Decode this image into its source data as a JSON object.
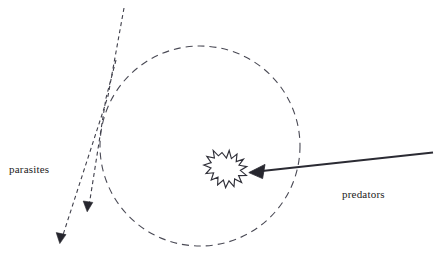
{
  "diagram": {
    "background_color": "#ffffff",
    "stroke_color": "#3a3a46",
    "arrow_color": "#2b2b33",
    "text_color": "#1b1b1b",
    "labels": {
      "parasites": "parasites",
      "predators": "predators"
    },
    "shapes": {
      "population_circle": {
        "name": "dashed-circle",
        "center_x": 200,
        "center_y": 146,
        "radius": 100,
        "style": "dashed"
      },
      "burst": {
        "name": "starburst",
        "center_x": 222,
        "center_y": 170,
        "radius": 17,
        "points": 13
      },
      "predator_arrow": {
        "name": "predator-arrow",
        "from_x": 433,
        "from_y": 152,
        "to_x": 249,
        "to_y": 172,
        "style": "solid"
      },
      "parasite_arrow_long": {
        "name": "parasite-arrow-long",
        "from_x": 124,
        "from_y": 8,
        "to_x": 59,
        "to_y": 243,
        "style": "dashed"
      },
      "parasite_arrow_short": {
        "name": "parasite-arrow-short",
        "from_x": 116,
        "from_y": 60,
        "to_x": 87,
        "to_y": 211,
        "style": "dashed"
      }
    }
  }
}
